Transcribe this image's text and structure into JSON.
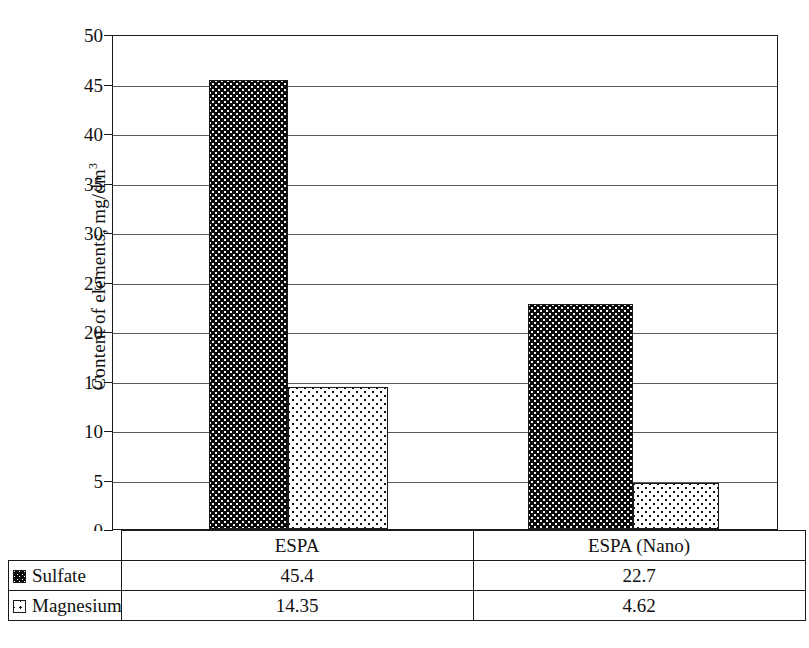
{
  "chart_data": {
    "type": "bar",
    "title": "",
    "xlabel": "",
    "ylabel": "Content of elements, mg/dm",
    "ylabel_sup": "3",
    "categories": [
      "ESPA",
      "ESPA (Nano)"
    ],
    "series": [
      {
        "name": "Sulfate",
        "values": [
          45.4,
          22.7
        ],
        "value_labels": [
          "45.4",
          "22.7"
        ],
        "swatch": "black-dotted"
      },
      {
        "name": "Magnesium",
        "values": [
          14.35,
          4.62
        ],
        "value_labels": [
          "14.35",
          "4.62"
        ],
        "swatch": "white-dotted"
      }
    ],
    "ylim": [
      0,
      50
    ],
    "yticks": [
      0,
      5,
      10,
      15,
      20,
      25,
      30,
      35,
      40,
      45,
      50
    ],
    "ytick_labels": [
      "0",
      "5",
      "10",
      "15",
      "20",
      "25",
      "30",
      "35",
      "40",
      "45",
      "50"
    ],
    "grid": true,
    "legend_position": "table-left-column",
    "table_mode": true
  },
  "colors": {
    "axis": "#1a1a1a",
    "gridline": "#555a5c",
    "sulfate_fill": "#0a0a0a",
    "sulfate_dots": "#f2f2f2",
    "magnesium_fill": "#fdfdfd",
    "magnesium_dots": "#111111",
    "background": "#ffffff"
  }
}
